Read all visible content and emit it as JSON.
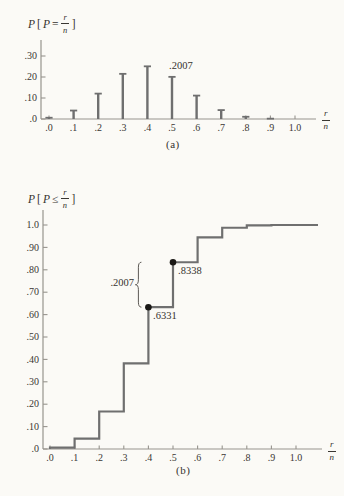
{
  "colors": {
    "line": "#6f6f6f",
    "axis": "#97948e",
    "text": "#3a3732",
    "dot": "#1a1816",
    "brace": "#5c5955",
    "background": "#fbfaf6"
  },
  "chart_data": [
    {
      "id": "pmf",
      "type": "stem",
      "title": "P [P = r/n]",
      "title_parts": {
        "sym1": "P",
        "open": "[",
        "sym2": "P",
        "rel": "=",
        "frac_num": "r",
        "frac_den": "n",
        "close": "]"
      },
      "caption": "(a)",
      "xlabel_frac": {
        "num": "r",
        "den": "n"
      },
      "x": [
        0.0,
        0.1,
        0.2,
        0.3,
        0.4,
        0.5,
        0.6,
        0.7,
        0.8,
        0.9,
        1.0
      ],
      "xtick_labels": [
        ".0",
        ".1",
        ".2",
        ".3",
        ".4",
        ".5",
        ".6",
        ".7",
        ".8",
        ".9",
        "1.0"
      ],
      "values": [
        0.006,
        0.0403,
        0.1209,
        0.215,
        0.2508,
        0.2007,
        0.1115,
        0.0425,
        0.0106,
        0.0016,
        0.0001
      ],
      "ytick_values": [
        0,
        0.1,
        0.2,
        0.3
      ],
      "ytick_labels": [
        ".0",
        ".10",
        ".20",
        ".30"
      ],
      "ylim": [
        0,
        0.33
      ],
      "xlim": [
        0,
        1.1
      ],
      "grid": false,
      "annotation": {
        "label": ".2007",
        "x": 0.5,
        "value": 0.2007
      }
    },
    {
      "id": "cdf",
      "type": "step",
      "title": "P [P ≤ r/n]",
      "title_parts": {
        "sym1": "P",
        "open": "[",
        "sym2": "P",
        "rel": "≤",
        "frac_num": "r",
        "frac_den": "n",
        "close": "]"
      },
      "caption": "(b)",
      "xlabel_frac": {
        "num": "r",
        "den": "n"
      },
      "x": [
        0.0,
        0.1,
        0.2,
        0.3,
        0.4,
        0.5,
        0.6,
        0.7,
        0.8,
        0.9,
        1.0
      ],
      "xtick_labels": [
        ".0",
        ".1",
        ".2",
        ".3",
        ".4",
        ".5",
        ".6",
        ".7",
        ".8",
        ".9",
        "1.0"
      ],
      "values": [
        0.006,
        0.0464,
        0.1673,
        0.3823,
        0.6331,
        0.8338,
        0.9452,
        0.9877,
        0.9983,
        0.9999,
        1.0
      ],
      "ytick_values": [
        0,
        0.1,
        0.2,
        0.3,
        0.4,
        0.5,
        0.6,
        0.7,
        0.8,
        0.9,
        1.0
      ],
      "ytick_labels": [
        ".0",
        ".10",
        ".20",
        ".30",
        ".40",
        ".50",
        ".60",
        ".70",
        ".80",
        ".90",
        "1.0"
      ],
      "ylim": [
        0,
        1.05
      ],
      "xlim": [
        0,
        1.15
      ],
      "grid": false,
      "marked_points": [
        {
          "x": 0.4,
          "y": 0.6331,
          "label": ".6331"
        },
        {
          "x": 0.5,
          "y": 0.8338,
          "label": ".8338"
        }
      ],
      "jump_annotation": {
        "label": ".2007",
        "x": 0.4,
        "from": 0.6331,
        "to": 0.8338
      }
    }
  ]
}
